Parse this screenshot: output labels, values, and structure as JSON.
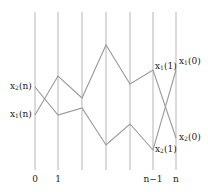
{
  "diagram": {
    "type": "polyline-crossing diagram",
    "colors": {
      "vertical": "#b5b5b5",
      "path": "#9a9a9a",
      "text": "#222222",
      "background": "#ffffff"
    },
    "verticals": {
      "x": [
        35,
        58,
        82,
        106,
        130,
        153,
        176
      ],
      "y_top": 12,
      "y_bottom": 170
    },
    "ticks": [
      {
        "label": "0",
        "x": 35
      },
      {
        "label": "1",
        "x": 58
      },
      {
        "label": "n−1",
        "x": 153
      },
      {
        "label": "n",
        "x": 176
      }
    ],
    "paths": [
      {
        "name": "path-a",
        "points": [
          [
            35,
            87
          ],
          [
            58,
            115
          ],
          [
            82,
            108
          ],
          [
            106,
            145
          ],
          [
            130,
            124
          ],
          [
            153,
            150
          ],
          [
            176,
            70
          ]
        ]
      },
      {
        "name": "path-b",
        "points": [
          [
            35,
            115
          ],
          [
            58,
            76
          ],
          [
            82,
            98
          ],
          [
            106,
            45
          ],
          [
            130,
            84
          ],
          [
            153,
            70
          ],
          [
            176,
            138
          ]
        ]
      }
    ],
    "labels": [
      {
        "name": "label-x2-n",
        "base": "x",
        "sub": "2",
        "arg": "(n)",
        "x": 10,
        "y": 82
      },
      {
        "name": "label-x1-n",
        "base": "x",
        "sub": "1",
        "arg": "(n)",
        "x": 10,
        "y": 110
      },
      {
        "name": "label-x1-1-top",
        "base": "x",
        "sub": "1",
        "arg": "(1)",
        "x": 155,
        "y": 62
      },
      {
        "name": "label-x1-0-top",
        "base": "x",
        "sub": "1",
        "arg": "(0)",
        "x": 179,
        "y": 57
      },
      {
        "name": "label-x2-1-bottom",
        "base": "x",
        "sub": "2",
        "arg": "(1)",
        "x": 155,
        "y": 145
      },
      {
        "name": "label-x2-0-bottom",
        "base": "x",
        "sub": "2",
        "arg": "(0)",
        "x": 179,
        "y": 133
      }
    ]
  }
}
